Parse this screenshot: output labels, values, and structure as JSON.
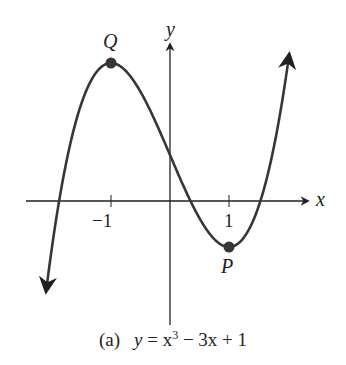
{
  "chart_data": {
    "type": "line",
    "title": "",
    "caption_tag": "(a)",
    "equation": "y = x³ − 3x + 1",
    "function": "x^3 - 3x + 1",
    "xlabel": "x",
    "ylabel": "y",
    "x_ticks": [
      -1,
      1
    ],
    "x_tick_labels": [
      "−1",
      "1"
    ],
    "xlim": [
      -2.1,
      2.02
    ],
    "ylim": [
      -2.6,
      3.2
    ],
    "grid": false,
    "legend": null,
    "points": [
      {
        "label": "Q",
        "x": -1,
        "y": 3,
        "description": "local maximum"
      },
      {
        "label": "P",
        "x": 1,
        "y": -1,
        "description": "local minimum"
      }
    ],
    "sample_x": [
      -2.1,
      -2.0,
      -1.5,
      -1.0,
      -0.5,
      0,
      0.5,
      1.0,
      1.5,
      2.0
    ],
    "sample_y": [
      -2.961,
      -1,
      2.125,
      3,
      2.375,
      1,
      -0.375,
      -1,
      0.875,
      3
    ],
    "colors": {
      "curve": "#3a3536",
      "points": "#3a3536",
      "axes": "#231f20"
    }
  },
  "labels": {
    "x_axis": "x",
    "y_axis": "y",
    "tick_neg1": "−1",
    "tick_pos1": "1",
    "point_q": "Q",
    "point_p": "P",
    "caption_tag": "(a)",
    "caption_lhs": "y",
    "caption_eq": " = x",
    "caption_exp": "3",
    "caption_rest": " − 3x + 1"
  }
}
